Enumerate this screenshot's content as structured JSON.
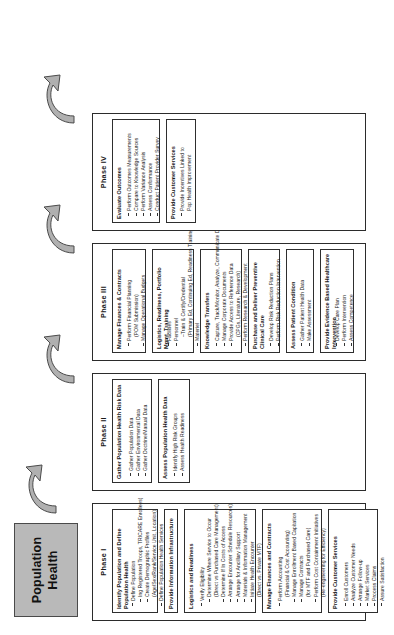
{
  "title": {
    "line1": "Population",
    "line2": "Health"
  },
  "icons": {
    "phase_arrow": "curved-arrow-icon"
  },
  "colors": {
    "title_fill": "#b9b9b9",
    "arrow_fill": "#b0b0b0",
    "line": "#2e2e2e"
  },
  "phases": [
    {
      "label": "Phase I",
      "groups": [
        {
          "title": "Identify Population and Define Population Health",
          "bullets": [
            {
              "text": "Define Population",
              "level": 0
            },
            {
              "text": "Ing Registered Troops, TRICARE Enrollees)",
              "level": 1
            },
            {
              "text": "Create Demographic Profiles",
              "level": 1
            },
            {
              "text": "(Age/Sex/Rank/Service Unit, Location)",
              "level": 1
            },
            {
              "text": "Define Population Health Services",
              "level": 0
            }
          ]
        },
        {
          "title": "Provide Information Infrastructure",
          "bullets": []
        },
        {
          "title": "Logistics and Readiness",
          "bullets": [
            {
              "text": "Verify Eligibility",
              "level": 0
            },
            {
              "text": "Determine Where Service to Occur",
              "level": 1
            },
            {
              "text": "(Direct vs Purchased Care Management)",
              "level": 1
            },
            {
              "text": "Determine If In Costs of Access",
              "level": 1
            },
            {
              "text": "Arrange Encounter Schedule Resources)",
              "level": 1
            },
            {
              "text": "Arrange for Ancillary Support",
              "level": 1
            },
            {
              "text": "Materials & Information Management",
              "level": 1
            },
            {
              "text": "Initiate Health Encounter",
              "level": 1
            },
            {
              "text": "(Direct vs. Private MTF)",
              "level": 1
            }
          ]
        },
        {
          "title": "Manage Finances and Contracts",
          "bullets": [
            {
              "text": "Perform Accounting",
              "level": 0
            },
            {
              "text": "(Financial & Cost Accounting)",
              "level": 1
            },
            {
              "text": "Manage Enrollment Based Capitation",
              "level": 1
            },
            {
              "text": "Manage Contracts",
              "level": 1
            },
            {
              "text": "(for MTF and Purchased Care)",
              "level": 1
            },
            {
              "text": "Perform Cost Containment Initiatives",
              "level": 1
            },
            {
              "text": "(Re-engineering for Efficiency)",
              "level": 1
            }
          ]
        },
        {
          "title": "Provide Customer Services",
          "bullets": [
            {
              "text": "Enroll Customers",
              "level": 0
            },
            {
              "text": "Analyze Customer Needs",
              "level": 0
            },
            {
              "text": "Arrange Follow-up",
              "level": 0
            },
            {
              "text": "Market Services",
              "level": 0
            },
            {
              "text": "Process Claims",
              "level": 0
            },
            {
              "text": "Assure Satisfaction",
              "level": 0
            }
          ]
        }
      ]
    },
    {
      "label": "Phase II",
      "groups": [
        {
          "title": "Gather Population Health Risk Data",
          "bullets": [
            {
              "text": "Gather Population Data",
              "level": 0
            },
            {
              "text": "Gather Environmental Data",
              "level": 0
            },
            {
              "text": "Gather Doctrine/Manual Data",
              "level": 0
            }
          ]
        },
        {
          "title": "Assess Population Health Data",
          "bullets": [
            {
              "text": "Identify High Risk Groups",
              "level": 0
            },
            {
              "text": "Assess Health Readiness",
              "level": 0
            }
          ]
        }
      ]
    },
    {
      "label": "Phase III",
      "groups": [
        {
          "title": "Manage Finances & Contracts",
          "bullets": [
            {
              "text": "Perform Financial Planning",
              "level": 0
            },
            {
              "text": "(POM Submission)",
              "level": 1
            },
            {
              "text": "Manage Operational Budgets",
              "level": 0
            }
          ]
        },
        {
          "title": "Logistics, Readiness, Portfolio Mgmt, Training",
          "bullets": [
            {
              "text": "Facilities",
              "level": 0
            },
            {
              "text": "Personnel",
              "level": 0
            },
            {
              "text": "–Train & Certify/Credential",
              "level": 1
            },
            {
              "text": "(Primary Ed, Continuing Ed, Readiness Training)",
              "level": 1
            },
            {
              "text": "Materiel",
              "level": 0
            }
          ]
        },
        {
          "title": "Knowledge Transfers",
          "bullets": [
            {
              "text": "Capture, Track/Monitor, Analyze, Communicate Data",
              "level": 0
            },
            {
              "text": "Manage Corporate Documents",
              "level": 0
            },
            {
              "text": "Provide Access to Reference Data",
              "level": 0
            },
            {
              "text": "(CPGs, Literature, Research)",
              "level": 1
            },
            {
              "text": "Perform Research & Development",
              "level": 0
            }
          ]
        },
        {
          "title": "Purchase and Deliver Preventive Clinical Care",
          "bullets": [
            {
              "text": "Develop Risk Reduction Plans",
              "level": 0
            },
            {
              "text": "Perform Risk Reduction Intervention",
              "level": 0
            }
          ]
        },
        {
          "title": "Assess Patient Condition",
          "bullets": [
            {
              "text": "Gather Patient Health Data",
              "level": 0
            },
            {
              "text": "Make Assessment",
              "level": 0
            }
          ]
        },
        {
          "title": "Provide Evidence Based Healthcare Intervention",
          "bullets": [
            {
              "text": "Develop Care Plan",
              "level": 0
            },
            {
              "text": "Perform Intervention",
              "level": 0
            },
            {
              "text": "Assess Competence",
              "level": 0
            }
          ]
        }
      ]
    },
    {
      "label": "Phase IV",
      "groups": [
        {
          "title": "Evaluate Outcomes",
          "bullets": [
            {
              "text": "Perform Outcomes Measurements",
              "level": 0
            },
            {
              "text": "Compare to Knowledge Sources",
              "level": 0
            },
            {
              "text": "Perform Variance Analysis",
              "level": 0
            },
            {
              "text": "Assess Conformance",
              "level": 0
            },
            {
              "text": "Conduct Patient Provider Survey",
              "level": 0
            }
          ]
        },
        {
          "title": "Provide Customer Services",
          "bullets": [
            {
              "text": "Provide Incentives Linked to",
              "level": 0
            },
            {
              "text": "Pop Health Improvement",
              "level": 1
            }
          ]
        }
      ]
    }
  ]
}
